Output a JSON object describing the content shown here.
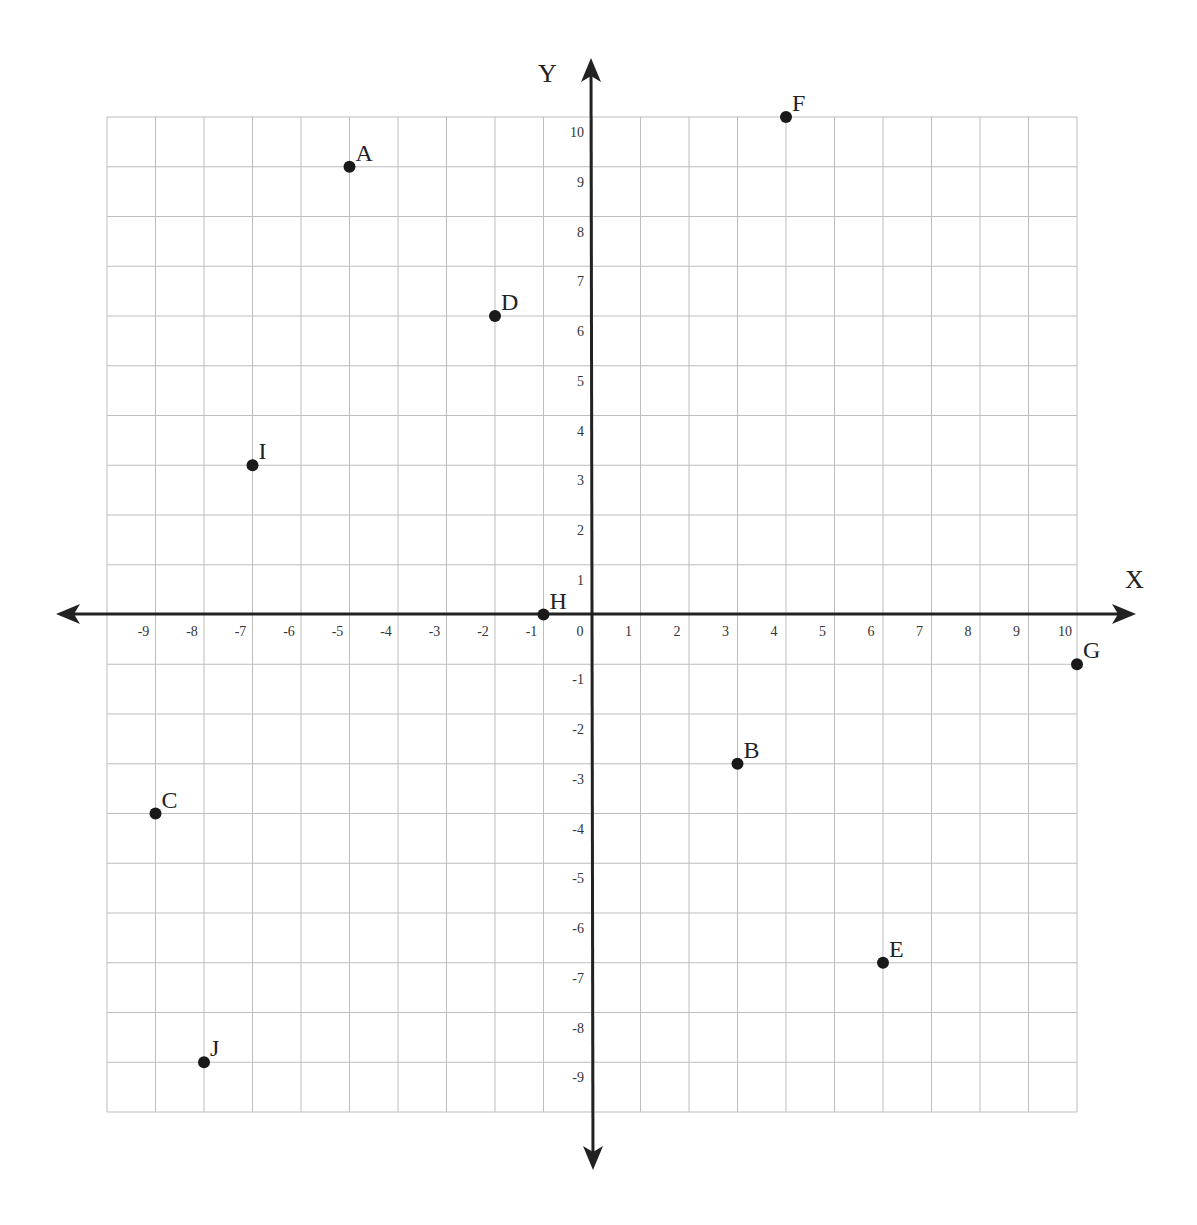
{
  "chart_data": {
    "type": "scatter",
    "title": "",
    "xlabel": "X",
    "ylabel": "Y",
    "xlim": [
      -10,
      10
    ],
    "ylim": [
      -10,
      10
    ],
    "grid": true,
    "x_ticks": [
      "-9",
      "-8",
      "-7",
      "-6",
      "-5",
      "-4",
      "-3",
      "-2",
      "-1",
      "0",
      "1",
      "2",
      "3",
      "4",
      "5",
      "6",
      "7",
      "8",
      "9",
      "10"
    ],
    "y_ticks": [
      "10",
      "9",
      "8",
      "7",
      "6",
      "5",
      "4",
      "3",
      "2",
      "1",
      "-1",
      "-2",
      "-3",
      "-4",
      "-5",
      "-6",
      "-7",
      "-8",
      "-9"
    ],
    "points": [
      {
        "label": "A",
        "x": -5,
        "y": 9
      },
      {
        "label": "B",
        "x": 3,
        "y": -3
      },
      {
        "label": "C",
        "x": -9,
        "y": -4
      },
      {
        "label": "D",
        "x": -2,
        "y": 6
      },
      {
        "label": "E",
        "x": 6,
        "y": -7
      },
      {
        "label": "F",
        "x": 4,
        "y": 10
      },
      {
        "label": "G",
        "x": 10,
        "y": -1
      },
      {
        "label": "H",
        "x": -1,
        "y": 0
      },
      {
        "label": "I",
        "x": -7,
        "y": 3
      },
      {
        "label": "J",
        "x": -8,
        "y": -9
      }
    ],
    "colors": {
      "point": "#1a1a1a",
      "axis": "#222222",
      "grid": "#bdbdbd"
    }
  }
}
